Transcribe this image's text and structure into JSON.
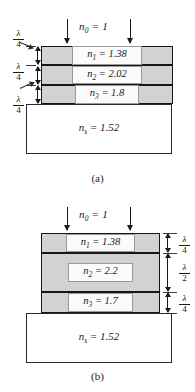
{
  "figure": {
    "type": "optics-thin-film-diagram",
    "panels": [
      {
        "caption": "(a)",
        "incident_medium": "n0 = 1",
        "incident_medium_symbol": "n",
        "incident_medium_sub": "0",
        "incident_medium_value": "= 1",
        "arrow_count": 2,
        "thickness_labels_side": "left",
        "layers": [
          {
            "symbol": "n",
            "sub": "1",
            "value": "= 1.38",
            "label": "n1 = 1.38",
            "thickness": "λ/4",
            "thickness_num": "λ",
            "thickness_den": "4"
          },
          {
            "symbol": "n",
            "sub": "2",
            "value": "= 2.02",
            "label": "n2 = 2.02",
            "thickness": "λ/4",
            "thickness_num": "λ",
            "thickness_den": "4"
          },
          {
            "symbol": "n",
            "sub": "3",
            "value": "= 1.8",
            "label": "n3 = 1.8",
            "thickness": "λ/4",
            "thickness_num": "λ",
            "thickness_den": "4"
          }
        ],
        "substrate": {
          "symbol": "n",
          "sub": "s",
          "value": "= 1.52",
          "label": "ns = 1.52"
        }
      },
      {
        "caption": "(b)",
        "incident_medium": "n0 = 1",
        "incident_medium_symbol": "n",
        "incident_medium_sub": "0",
        "incident_medium_value": "= 1",
        "arrow_count": 2,
        "thickness_labels_side": "right",
        "layers": [
          {
            "symbol": "n",
            "sub": "1",
            "value": "= 1.38",
            "label": "n1 = 1.38",
            "thickness": "λ/4",
            "thickness_num": "λ",
            "thickness_den": "4"
          },
          {
            "symbol": "n",
            "sub": "2",
            "value": "= 2.2",
            "label": "n2 = 2.2",
            "thickness": "λ/2",
            "thickness_num": "λ",
            "thickness_den": "2"
          },
          {
            "symbol": "n",
            "sub": "3",
            "value": "= 1.7",
            "label": "n3 = 1.7",
            "thickness": "λ/4",
            "thickness_num": "λ",
            "thickness_den": "4"
          }
        ],
        "substrate": {
          "symbol": "n",
          "sub": "s",
          "value": "= 1.52",
          "label": "ns = 1.52"
        }
      }
    ],
    "colors": {
      "layer_fill": "#d2d2d2",
      "label_fill": "#fbfbfb",
      "substrate_fill": "#ffffff",
      "stroke": "#161616",
      "background": "#ffffff"
    }
  }
}
